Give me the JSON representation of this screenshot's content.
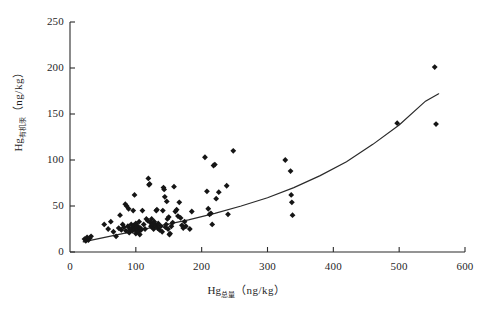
{
  "chart_data": {
    "type": "scatter",
    "title": "",
    "xlabel_prefix": "Hg",
    "xlabel_subscript": "总量",
    "xlabel_units": "（ng/kg）",
    "ylabel_prefix": "Hg",
    "ylabel_subscript": "有机汞",
    "ylabel_units": "（ng/kg）",
    "xlim": [
      0,
      600
    ],
    "ylim": [
      0,
      250
    ],
    "xticks": [
      0,
      100,
      200,
      300,
      400,
      500,
      600
    ],
    "xtick_labels": [
      "0",
      "100",
      "200",
      "300",
      "400",
      "500",
      "600"
    ],
    "yticks": [
      0,
      50,
      100,
      150,
      200,
      250
    ],
    "ytick_labels": [
      "0",
      "50",
      "100",
      "150",
      "200",
      "250"
    ],
    "grid": false,
    "legend": false,
    "marker": "diamond",
    "marker_color": "#151515",
    "line_color": "#2a2a2a",
    "points": [
      [
        22,
        14
      ],
      [
        24,
        12
      ],
      [
        26,
        16
      ],
      [
        28,
        13
      ],
      [
        30,
        15
      ],
      [
        32,
        17
      ],
      [
        52,
        30
      ],
      [
        58,
        25
      ],
      [
        62,
        33
      ],
      [
        66,
        22
      ],
      [
        70,
        17
      ],
      [
        74,
        26
      ],
      [
        76,
        40
      ],
      [
        78,
        24
      ],
      [
        80,
        30
      ],
      [
        82,
        27
      ],
      [
        84,
        52
      ],
      [
        85,
        23
      ],
      [
        86,
        50
      ],
      [
        88,
        28
      ],
      [
        89,
        47
      ],
      [
        90,
        21
      ],
      [
        91,
        25
      ],
      [
        92,
        24
      ],
      [
        93,
        30
      ],
      [
        94,
        26
      ],
      [
        95,
        23
      ],
      [
        96,
        45
      ],
      [
        97,
        29
      ],
      [
        98,
        62
      ],
      [
        98,
        27
      ],
      [
        99,
        25
      ],
      [
        100,
        20
      ],
      [
        100,
        31
      ],
      [
        101,
        26
      ],
      [
        102,
        24
      ],
      [
        103,
        28
      ],
      [
        104,
        22
      ],
      [
        105,
        33
      ],
      [
        106,
        19
      ],
      [
        107,
        26
      ],
      [
        108,
        24
      ],
      [
        110,
        45
      ],
      [
        112,
        30
      ],
      [
        114,
        25
      ],
      [
        116,
        36
      ],
      [
        118,
        34
      ],
      [
        119,
        80
      ],
      [
        120,
        73
      ],
      [
        121,
        74
      ],
      [
        122,
        32
      ],
      [
        123,
        28
      ],
      [
        124,
        36
      ],
      [
        125,
        27
      ],
      [
        126,
        30
      ],
      [
        127,
        25
      ],
      [
        128,
        33
      ],
      [
        130,
        29
      ],
      [
        131,
        45
      ],
      [
        132,
        46
      ],
      [
        133,
        26
      ],
      [
        134,
        31
      ],
      [
        136,
        24
      ],
      [
        138,
        28
      ],
      [
        140,
        22
      ],
      [
        141,
        45
      ],
      [
        142,
        70
      ],
      [
        143,
        68
      ],
      [
        144,
        60
      ],
      [
        145,
        27
      ],
      [
        146,
        30
      ],
      [
        147,
        55
      ],
      [
        148,
        36
      ],
      [
        149,
        25
      ],
      [
        150,
        38
      ],
      [
        151,
        19
      ],
      [
        152,
        20
      ],
      [
        154,
        28
      ],
      [
        156,
        32
      ],
      [
        158,
        71
      ],
      [
        160,
        44
      ],
      [
        162,
        46
      ],
      [
        164,
        39
      ],
      [
        166,
        54
      ],
      [
        168,
        37
      ],
      [
        170,
        29
      ],
      [
        172,
        26
      ],
      [
        174,
        33
      ],
      [
        176,
        28
      ],
      [
        182,
        25
      ],
      [
        185,
        44
      ],
      [
        205,
        103
      ],
      [
        208,
        66
      ],
      [
        210,
        47
      ],
      [
        212,
        41
      ],
      [
        214,
        42
      ],
      [
        216,
        30
      ],
      [
        218,
        94
      ],
      [
        220,
        95
      ],
      [
        222,
        58
      ],
      [
        226,
        65
      ],
      [
        238,
        72
      ],
      [
        240,
        41
      ],
      [
        248,
        110
      ],
      [
        327,
        100
      ],
      [
        335,
        88
      ],
      [
        336,
        62
      ],
      [
        337,
        54
      ],
      [
        338,
        40
      ],
      [
        497,
        140
      ],
      [
        554,
        201
      ],
      [
        556,
        139
      ]
    ],
    "fit_curve": {
      "description": "exponential trend line",
      "x": [
        20,
        60,
        100,
        140,
        180,
        220,
        260,
        300,
        340,
        380,
        420,
        460,
        500,
        540,
        560
      ],
      "y": [
        11,
        17,
        23,
        29,
        35,
        42,
        50,
        59,
        70,
        83,
        98,
        117,
        138,
        164,
        172
      ]
    }
  },
  "axes": {
    "xtick_labels": [
      "0",
      "100",
      "200",
      "300",
      "400",
      "500",
      "600"
    ],
    "ytick_labels": [
      "0",
      "50",
      "100",
      "150",
      "200",
      "250"
    ]
  }
}
